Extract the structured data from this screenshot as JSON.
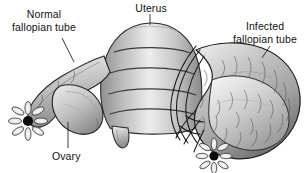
{
  "figure": {
    "kind": "anatomical-illustration",
    "background_color": "#ffffff",
    "label_color": "#111111"
  },
  "labels": {
    "normal_tube": {
      "line1": "Normal",
      "line2": "fallopian tube"
    },
    "uterus": {
      "line1": "Uterus"
    },
    "infected_tube": {
      "line1": "Infected",
      "line2": "fallopian tube"
    },
    "ovary": {
      "line1": "Ovary"
    }
  },
  "structures": [
    {
      "name": "uterus-body",
      "note": "central rounded dome with four horizontal contour folds"
    },
    {
      "name": "cervix-stump",
      "note": "short tube descending from uterus base"
    },
    {
      "name": "normal-fallopian-tube",
      "note": "smooth slender tube on the left, tapering"
    },
    {
      "name": "normal-fimbriae",
      "note": "white petal rosette with dark center, left"
    },
    {
      "name": "left-ovary",
      "note": "oval bean-shaped body beneath the left tube"
    },
    {
      "name": "infected-fallopian-tube",
      "note": "swollen coiled tube on the right with dense vessel hatching"
    },
    {
      "name": "infected-fimbriae",
      "note": "white petal rosette with dark center, lower right"
    },
    {
      "name": "adhesion-bands",
      "note": "dark curved strands between uterus and infected tube"
    }
  ],
  "palette": {
    "outline": "#1c1c1c",
    "tissue_light": "#f2f2f2",
    "tissue_mid": "#c9c9c9",
    "tissue_dark": "#8d8d8d",
    "tissue_shadow": "#6a6a6a",
    "fimbriae_center": "#0d0d0d"
  }
}
